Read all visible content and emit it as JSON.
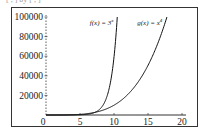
{
  "caption_fragment": "[ , ] by [ , ]",
  "chart_data": {
    "type": "line",
    "title": "",
    "xlabel": "",
    "ylabel": "",
    "xlim": [
      0,
      20
    ],
    "ylim": [
      0,
      100000
    ],
    "x_ticks": [
      0,
      5,
      10,
      15,
      20
    ],
    "y_ticks": [
      20000,
      40000,
      60000,
      80000,
      100000
    ],
    "x_tick_labels": [
      "0",
      "5",
      "10",
      "15",
      "20"
    ],
    "y_tick_labels": [
      "20000",
      "40000",
      "60000",
      "80000",
      "100000"
    ],
    "origin_label": "0",
    "grid": false,
    "legend": "none",
    "series": [
      {
        "name": "f(x) = 3^x",
        "label_text": "f(x) = 3",
        "label_exp": "x",
        "formula": "3^x",
        "x_end": 10.48
      },
      {
        "name": "g(x) = x^4",
        "label_text": "g(x) = x",
        "label_exp": "4",
        "formula": "x^4",
        "x_end": 17.78
      }
    ],
    "annotations": [
      {
        "text": "f(x) = 3^x",
        "near_x": 8.5,
        "near_y": 95000
      },
      {
        "text": "g(x) = x^4",
        "near_x": 14,
        "near_y": 95000
      }
    ]
  },
  "colors": {
    "frame": "#333333",
    "axis": "#333333",
    "curve": "#111111",
    "background": "#ffffff"
  }
}
